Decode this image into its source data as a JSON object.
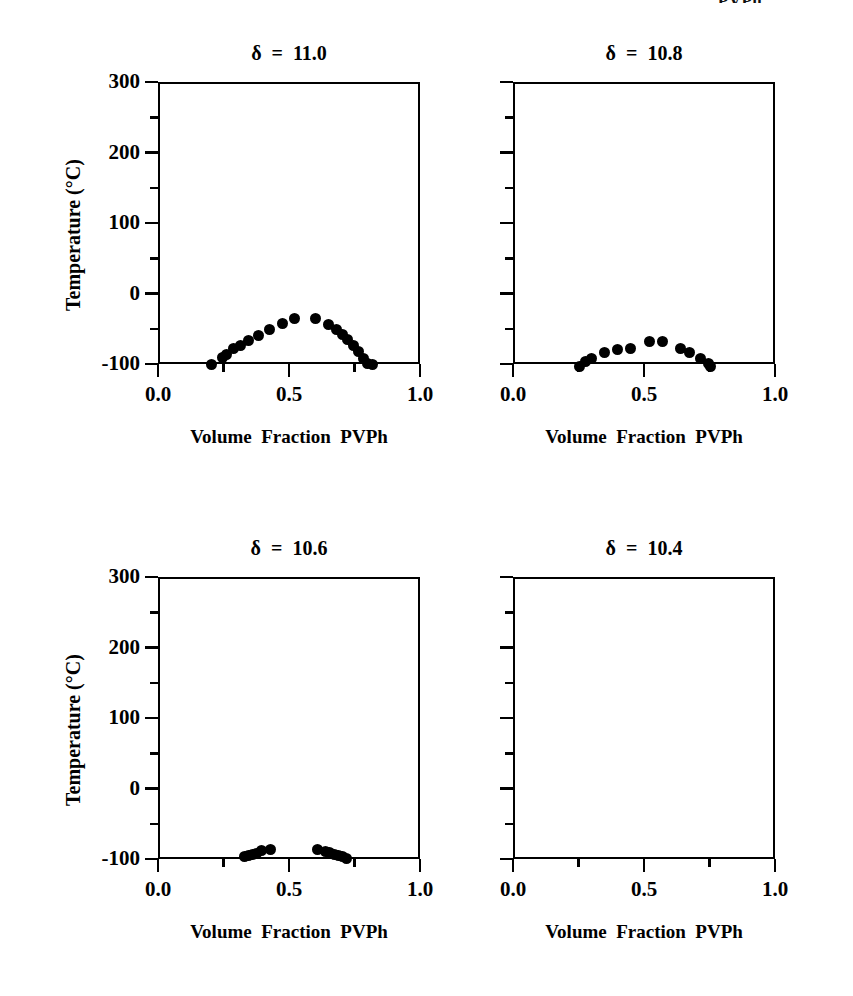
{
  "figure": {
    "clipped_top_text": "PVPh",
    "axis_titles": {
      "x": "Volume  Fraction  PVPh",
      "y": "Temperature  (°C)"
    },
    "x_ticks": [
      "0.0",
      "0.5",
      "1.0"
    ],
    "x_tick_values": [
      0.0,
      0.5,
      1.0
    ],
    "y_ticks": [
      "300",
      "200",
      "100",
      "0",
      "-100"
    ],
    "y_tick_values": [
      300,
      200,
      100,
      0,
      -100
    ],
    "x_minor_values": [
      0.25,
      0.75
    ],
    "y_minor_values": [
      250,
      150,
      50,
      -50
    ]
  },
  "chart_data": {
    "type": "scatter",
    "xlabel": "Volume  Fraction  PVPh",
    "ylabel": "Temperature  (°C)",
    "xlim": [
      0.0,
      1.0
    ],
    "ylim": [
      -100,
      300
    ],
    "grid": false,
    "legend": "none",
    "panels": [
      {
        "id": "panel-delta-11-0",
        "title": "δ  =  11.0",
        "delta": 11.0,
        "series_name": "binodal",
        "points": [
          {
            "x": 0.205,
            "y": -100
          },
          {
            "x": 0.245,
            "y": -91
          },
          {
            "x": 0.26,
            "y": -86
          },
          {
            "x": 0.29,
            "y": -78
          },
          {
            "x": 0.315,
            "y": -74
          },
          {
            "x": 0.345,
            "y": -66
          },
          {
            "x": 0.385,
            "y": -59
          },
          {
            "x": 0.425,
            "y": -51
          },
          {
            "x": 0.475,
            "y": -42
          },
          {
            "x": 0.52,
            "y": -36
          },
          {
            "x": 0.6,
            "y": -36
          },
          {
            "x": 0.65,
            "y": -44
          },
          {
            "x": 0.68,
            "y": -51
          },
          {
            "x": 0.705,
            "y": -58
          },
          {
            "x": 0.725,
            "y": -65
          },
          {
            "x": 0.745,
            "y": -74
          },
          {
            "x": 0.765,
            "y": -82
          },
          {
            "x": 0.785,
            "y": -92
          },
          {
            "x": 0.8,
            "y": -99
          },
          {
            "x": 0.82,
            "y": -101
          }
        ]
      },
      {
        "id": "panel-delta-10-8",
        "title": "δ  =  10.8",
        "delta": 10.8,
        "series_name": "binodal",
        "points": [
          {
            "x": 0.255,
            "y": -103
          },
          {
            "x": 0.275,
            "y": -96
          },
          {
            "x": 0.3,
            "y": -92
          },
          {
            "x": 0.35,
            "y": -84
          },
          {
            "x": 0.4,
            "y": -80
          },
          {
            "x": 0.45,
            "y": -78
          },
          {
            "x": 0.52,
            "y": -68
          },
          {
            "x": 0.57,
            "y": -68
          },
          {
            "x": 0.64,
            "y": -78
          },
          {
            "x": 0.675,
            "y": -83
          },
          {
            "x": 0.715,
            "y": -92
          },
          {
            "x": 0.745,
            "y": -99
          },
          {
            "x": 0.755,
            "y": -103
          }
        ]
      },
      {
        "id": "panel-delta-10-6",
        "title": "δ  =  10.6",
        "delta": 10.6,
        "series_name": "binodal",
        "points": [
          {
            "x": 0.33,
            "y": -97
          },
          {
            "x": 0.345,
            "y": -95
          },
          {
            "x": 0.36,
            "y": -93
          },
          {
            "x": 0.375,
            "y": -92
          },
          {
            "x": 0.395,
            "y": -88
          },
          {
            "x": 0.43,
            "y": -86
          },
          {
            "x": 0.61,
            "y": -87
          },
          {
            "x": 0.64,
            "y": -89
          },
          {
            "x": 0.655,
            "y": -91
          },
          {
            "x": 0.675,
            "y": -93
          },
          {
            "x": 0.69,
            "y": -95
          },
          {
            "x": 0.705,
            "y": -97
          },
          {
            "x": 0.718,
            "y": -99
          }
        ]
      },
      {
        "id": "panel-delta-10-4",
        "title": "δ  =  10.4",
        "delta": 10.4,
        "series_name": "binodal",
        "points": []
      }
    ]
  }
}
